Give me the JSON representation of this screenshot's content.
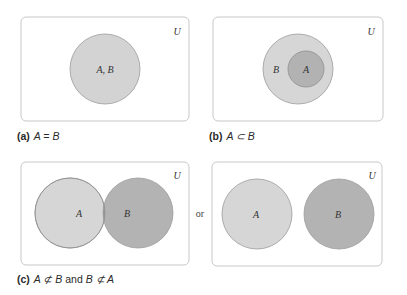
{
  "colors": {
    "background": "#ffffff",
    "panel_border": "#c8c8c8",
    "light_fill": "#d6d6d6",
    "dark_fill": "#b3b3b3",
    "overlap_fill": "#9a9a9a",
    "circle_stroke": "#9c9c9c"
  },
  "panels": [
    {
      "id": "a",
      "universe_label": "U",
      "circles": [
        {
          "label": "A, B",
          "fill": "light"
        }
      ],
      "caption": {
        "tag": "(a)",
        "math": "A = B"
      }
    },
    {
      "id": "b",
      "universe_label": "U",
      "circles": [
        {
          "label": "B",
          "fill": "light"
        },
        {
          "label": "A",
          "fill": "dark"
        }
      ],
      "caption": {
        "tag": "(b)",
        "math": "A ⊂ B"
      }
    },
    {
      "id": "c1",
      "universe_label": "U",
      "circles": [
        {
          "label": "A",
          "fill": "light"
        },
        {
          "label": "B",
          "fill": "dark"
        }
      ]
    },
    {
      "id": "c2",
      "universe_label": "U",
      "circles": [
        {
          "label": "A",
          "fill": "light"
        },
        {
          "label": "B",
          "fill": "dark"
        }
      ]
    }
  ],
  "connector": "or",
  "caption_c": {
    "tag": "(c)",
    "math1": "A ⊄ B",
    "and": "and",
    "math2": "B ⊄ A"
  }
}
